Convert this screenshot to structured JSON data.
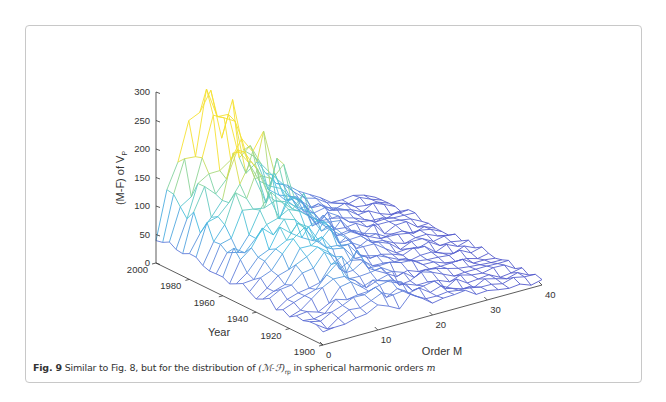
{
  "figure": {
    "label": "Fig. 9",
    "caption_pre": "Similar to Fig. 8, but for the distribution of ",
    "caption_math": "(ℳ-ℱ)",
    "caption_sub": "rp",
    "caption_post": " in spherical harmonic orders ",
    "caption_var": "m"
  },
  "chart_data": {
    "type": "surface",
    "title": "",
    "zlabel": "(M-F) of V",
    "zlabel_sub": "P",
    "xlabel": "Order M",
    "ylabel": "Year",
    "z_ticks": [
      "0",
      "50",
      "100",
      "150",
      "200",
      "250",
      "300"
    ],
    "year_ticks": [
      "2000",
      "1980",
      "1960",
      "1940",
      "1920",
      "1900"
    ],
    "order_ticks": [
      "0",
      "10",
      "20",
      "30",
      "40"
    ],
    "zlim": [
      0,
      300
    ],
    "year_range": [
      1900,
      2000
    ],
    "order_range": [
      0,
      40
    ],
    "colormap": "parula",
    "grid": false,
    "years": [
      2000,
      1990,
      1980,
      1970,
      1960,
      1950,
      1940,
      1930,
      1920,
      1910,
      1900
    ],
    "orders": [
      0,
      2,
      4,
      6,
      8,
      10,
      12,
      14,
      16,
      18,
      20,
      22,
      24,
      26,
      28,
      30,
      32,
      34,
      36,
      38,
      40
    ],
    "values_by_order_at_year_2000": [
      40,
      150,
      160,
      200,
      230,
      250,
      210,
      170,
      190,
      130,
      90,
      70,
      60,
      45,
      35,
      28,
      22,
      18,
      14,
      10,
      8
    ],
    "peak": {
      "year": 1995,
      "order": 8,
      "value": 290
    }
  },
  "colors": {
    "low": "#6b6fd4",
    "mid": "#47c3e0",
    "high": "#f0e23a",
    "axis": "#333333",
    "frame": "#c8c8c8"
  }
}
